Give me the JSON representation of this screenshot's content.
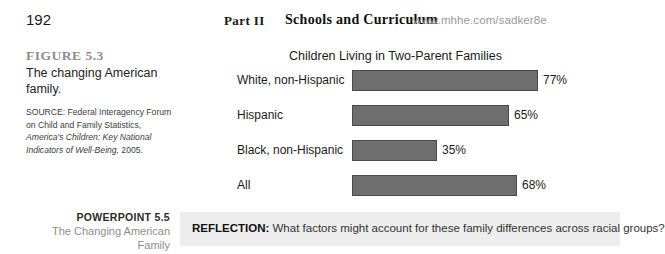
{
  "header": {
    "page_number": "192",
    "part_label": "Part II",
    "chapter_title": "Schools and Curriculum",
    "web_url": "www.mhhe.com/sadker8e"
  },
  "figure_caption": {
    "figure_number": "FIGURE 5.3",
    "figure_title": "The changing American family.",
    "source_prefix": "SOURCE: Federal Interagency Forum on Child and Family Statistics, ",
    "source_italic": "America's Children: Key National Indicators of Well-Being,",
    "source_suffix": " 2005."
  },
  "powerpoint": {
    "number": "POWERPOINT 5.5",
    "title_line1": "The Changing American",
    "title_line2": "Family"
  },
  "reflection": {
    "label": "REFLECTION:",
    "text": " What factors might account for these family differences across racial groups?"
  },
  "chart_data": {
    "type": "bar",
    "title": "Children Living in Two-Parent Families",
    "orientation": "horizontal",
    "categories": [
      "White, non-Hispanic",
      "Hispanic",
      "Black, non-Hispanic",
      "All"
    ],
    "values": [
      77,
      65,
      35,
      68
    ],
    "value_labels": [
      "77%",
      "65%",
      "35%",
      "68%"
    ],
    "xlabel": "",
    "ylabel": "",
    "xlim": [
      0,
      100
    ],
    "grid": false,
    "legend": false,
    "bar_color": "#6e6e6e",
    "bar_border_color": "#4a4a4a"
  }
}
